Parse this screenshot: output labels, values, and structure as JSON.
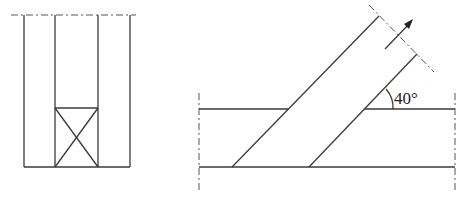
{
  "figures": {
    "left": {
      "description": "Vertical member with crossed box (section/blocking) at bottom of middle bay"
    },
    "right": {
      "description": "Inclined member crossing horizontal member",
      "angle_label": "40°",
      "angle_degrees": 40
    }
  },
  "colors": {
    "line": "#3a3a3a",
    "background": "#ffffff"
  }
}
